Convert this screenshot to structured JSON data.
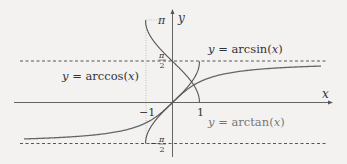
{
  "chart_data": {
    "type": "line",
    "title": "",
    "xlabel": "x",
    "ylabel": "y",
    "xlim": [
      -5.5,
      5.9
    ],
    "ylim": [
      -2.1,
      3.5
    ],
    "grid": false,
    "legend_position": "inline annotations",
    "x_ticks": [
      {
        "value": -1,
        "label": "−1"
      },
      {
        "value": 1,
        "label": "1"
      }
    ],
    "y_ticks": [
      {
        "value": 3.14159,
        "label": "π"
      },
      {
        "value": 1.5708,
        "label": "π/2"
      },
      {
        "value": -1.5708,
        "label": "−π/2"
      }
    ],
    "reference_lines": [
      {
        "orientation": "horizontal",
        "y": 1.5708,
        "style": "dashed",
        "label": "y = π/2"
      },
      {
        "orientation": "horizontal",
        "y": -1.5708,
        "style": "dashed",
        "label": "y = −π/2"
      },
      {
        "orientation": "vertical",
        "x": -1,
        "style": "dotted",
        "from": -1.5708,
        "to": 3.14159
      },
      {
        "orientation": "horizontal",
        "y": 3.14159,
        "style": "dotted",
        "from": -1,
        "to": 0
      }
    ],
    "series": [
      {
        "name": "y = arcsin(x)",
        "function": "arcsin",
        "domain": [
          -1,
          1
        ],
        "range": [
          -1.5708,
          1.5708
        ],
        "color": "#555555",
        "x": [
          -1,
          -0.5,
          0,
          0.5,
          1
        ],
        "values": [
          -1.5708,
          -0.5236,
          0,
          0.5236,
          1.5708
        ]
      },
      {
        "name": "y = arccos(x)",
        "function": "arccos",
        "domain": [
          -1,
          1
        ],
        "range": [
          0,
          3.14159
        ],
        "color": "#555555",
        "x": [
          -1,
          -0.5,
          0,
          0.5,
          1
        ],
        "values": [
          3.14159,
          2.0944,
          1.5708,
          1.0472,
          0
        ]
      },
      {
        "name": "y = arctan(x)",
        "function": "arctan",
        "domain": [
          -5.5,
          5.5
        ],
        "range": [
          -1.3909,
          1.3909
        ],
        "color": "#666666",
        "x": [
          -5.5,
          -2,
          -1,
          0,
          1,
          2,
          5.5
        ],
        "values": [
          -1.3909,
          -1.1071,
          -0.7854,
          0,
          0.7854,
          1.1071,
          1.3909
        ]
      }
    ],
    "annotations": [
      {
        "text": "y = arcsin(x)",
        "near": "top right of y-axis"
      },
      {
        "text": "y = arccos(x)",
        "near": "left upper region"
      },
      {
        "text": "y = arctan(x)",
        "near": "below x-axis right of 1"
      }
    ]
  },
  "labels": {
    "x_axis": "x",
    "y_axis": "y",
    "pi": "π",
    "pi_half_num": "π",
    "pi_half_den": "2",
    "neg_pi_half_sign": "−",
    "neg_pi_half_num": "π",
    "neg_pi_half_den": "2",
    "tick_neg1": "−1",
    "tick_1": "1",
    "arcsin_y": "y",
    "arcsin_eq": " = arcsin(",
    "arcsin_x": "x",
    "arcsin_close": ")",
    "arccos_y": "y",
    "arccos_eq": " = arccos(",
    "arccos_x": "x",
    "arccos_close": ")",
    "arctan_y": "y",
    "arctan_eq": " = arctan(",
    "arctan_x": "x",
    "arctan_close": ")"
  }
}
